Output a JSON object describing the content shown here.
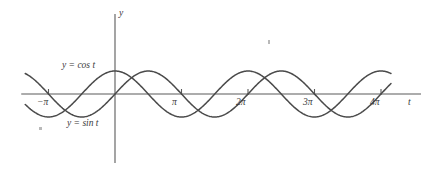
{
  "figure": {
    "background": "#ffffff",
    "ink_color": "#4a4a4a",
    "axis_color": "#5a5a5a"
  },
  "chart_data": {
    "type": "line",
    "title": "",
    "subtitle": "",
    "xlabel": "t",
    "ylabel": "y",
    "grid": false,
    "legend": "inline-curve-labels",
    "xlim": [
      -1.35,
      4.62
    ],
    "ylim": [
      -1.45,
      1.7
    ],
    "x_unit": "pi",
    "xticks": [
      -1,
      1,
      2,
      3,
      4
    ],
    "xtick_labels": [
      "−π",
      "π",
      "2π",
      "3π",
      "4π"
    ],
    "yticks": [],
    "ytick_labels": [],
    "axis_x_label": "t",
    "axis_y_label": "y",
    "series": [
      {
        "name": "y = cos t",
        "label": "y = cos t",
        "func": "cos",
        "amplitude": 1,
        "period_in_pi": 2,
        "phase": 0,
        "x_start_in_pi": -1.35,
        "x_end_in_pi": 4.15,
        "label_x_in_pi": -0.78,
        "label_y": 1.0,
        "sample_points_x_in_pi": [
          -1.35,
          -1.0,
          -0.75,
          -0.5,
          -0.25,
          0,
          0.25,
          0.5,
          0.75,
          1.0,
          1.25,
          1.5,
          1.75,
          2.0,
          2.25,
          2.5,
          2.75,
          3.0,
          3.25,
          3.5,
          3.75,
          4.0,
          4.15
        ],
        "sample_points_y": [
          0.891,
          1.0,
          0.707,
          0.0,
          -0.707,
          -1.0,
          -0.707,
          0.0,
          0.707,
          1.0,
          0.707,
          0.0,
          -0.707,
          -1.0,
          -0.707,
          0.0,
          0.707,
          1.0,
          0.707,
          0.0,
          -0.707,
          -1.0,
          -0.891
        ]
      },
      {
        "name": "y = sin t",
        "label": "y = sin t",
        "func": "sin",
        "amplitude": 1,
        "period_in_pi": 2,
        "phase": 0,
        "x_start_in_pi": -1.35,
        "x_end_in_pi": 4.15,
        "label_x_in_pi": -0.72,
        "label_y": -1.12,
        "sample_points_x_in_pi": [
          -1.35,
          -1.0,
          -0.75,
          -0.5,
          -0.25,
          0,
          0.25,
          0.5,
          0.75,
          1.0,
          1.25,
          1.5,
          1.75,
          2.0,
          2.25,
          2.5,
          2.75,
          3.0,
          3.25,
          3.5,
          3.75,
          4.0,
          4.15
        ],
        "sample_points_y": [
          0.454,
          0.0,
          -0.707,
          -1.0,
          -0.707,
          0.0,
          0.707,
          1.0,
          0.707,
          0.0,
          -0.707,
          -1.0,
          -0.707,
          0.0,
          0.707,
          1.0,
          0.707,
          0.0,
          -0.707,
          -1.0,
          -0.707,
          0.0,
          0.454
        ]
      }
    ],
    "annotations": [
      {
        "name": "cos-curve-label",
        "text": "y = cos t"
      },
      {
        "name": "sin-curve-label",
        "text": "y = sin t"
      }
    ],
    "specks": [
      {
        "name": "scan-speck-top",
        "x": 268,
        "y": 40,
        "w": 2,
        "h": 4
      },
      {
        "name": "scan-speck-left",
        "x": 39,
        "y": 127,
        "w": 3,
        "h": 3
      }
    ]
  },
  "labels": {
    "y_axis": "y",
    "t_axis": "t",
    "tick_neg_pi": "−π",
    "tick_pi": "π",
    "tick_2pi": "2π",
    "tick_3pi": "3π",
    "tick_4pi": "4π",
    "cos_label": "y = cos t",
    "sin_label": "y = sin t"
  }
}
